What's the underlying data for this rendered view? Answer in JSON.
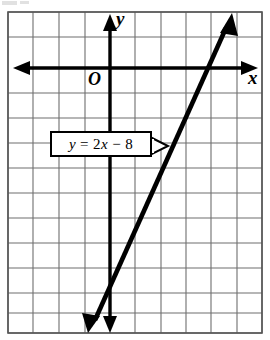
{
  "figure": {
    "type": "coordinate-plane-graph",
    "width": 270,
    "height": 340,
    "background": "#ffffff",
    "grid": {
      "color": "#6e6e6e",
      "border_color": "#555555",
      "cell_size": 25.4,
      "columns": 10,
      "rows": 13,
      "left": 8,
      "top": 12,
      "right": 262,
      "bottom": 333,
      "visible": true
    },
    "axes": {
      "color": "#000000",
      "x_axis": {
        "label": "x",
        "y_position": 68,
        "arrows": "both"
      },
      "y_axis": {
        "label": "y",
        "x_position": 110,
        "arrows": "both"
      },
      "origin_label": "O"
    },
    "callout": {
      "text_parts": {
        "y": "y",
        "eq": " = 2",
        "x": "x",
        "rest": " − 8"
      },
      "text": "y = 2x − 8",
      "border_color": "#000000",
      "fill": "#ffffff"
    }
  },
  "chart_data": {
    "type": "line",
    "title": "",
    "xlabel": "x",
    "ylabel": "y",
    "equation": "y = 2x − 8",
    "slope": 2,
    "y_intercept": -8,
    "x_intercept": 4,
    "annotations": [
      "y = 2x − 8",
      "O"
    ],
    "grid": true,
    "legend": "none",
    "xlim": [
      -4,
      6
    ],
    "ylim": [
      -11,
      2
    ],
    "series": [
      {
        "name": "y = 2x - 8",
        "points": [
          [
            -1.2,
            -10.4
          ],
          [
            0,
            -8
          ],
          [
            4,
            0
          ],
          [
            4.8,
            1.6
          ]
        ],
        "color": "#000000",
        "arrows": "both"
      }
    ]
  }
}
